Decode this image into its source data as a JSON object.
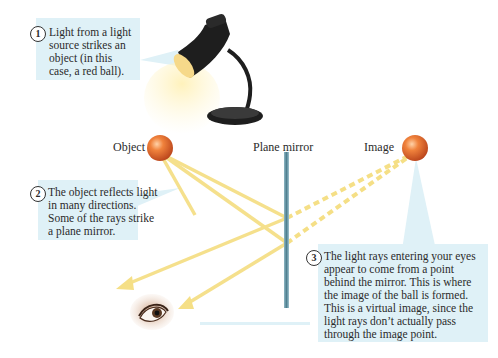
{
  "labels": {
    "object": "Object",
    "mirror": "Plane mirror",
    "image": "Image"
  },
  "callouts": [
    {
      "number": "1",
      "text": "Light from a light\nsource strikes an\nobject (in this\ncase, a red ball)."
    },
    {
      "number": "2",
      "text": "The object reflects light\nin many directions.\nSome of the rays strike\na plane mirror."
    },
    {
      "number": "3",
      "text": "The light rays entering your eyes\nappear to come from a point\nbehind the mirror. This is where\nthe image of the ball is formed.\nThis is a virtual image, since the\nlight rays don’t actually pass\nthrough the image point."
    }
  ],
  "icons": {
    "lamp": "desk-lamp-icon",
    "object_ball": "red-ball-icon",
    "image_ball": "red-ball-icon",
    "eye": "eye-icon",
    "mirror": "plane-mirror"
  },
  "colors": {
    "callout_bg": "#dff1f7",
    "ray": "#f5df86",
    "ball": "#e0652a",
    "mirror": "#5e8e9e",
    "lamp": "#1e1e1e"
  }
}
